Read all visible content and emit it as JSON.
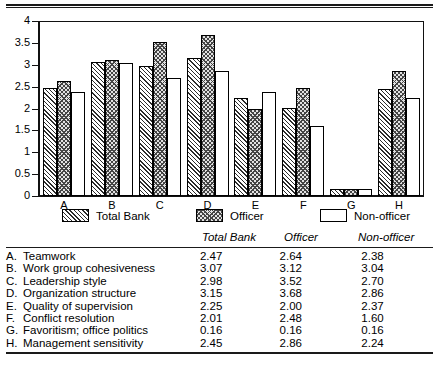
{
  "chart_data": {
    "type": "bar",
    "title": "",
    "xlabel": "",
    "ylabel": "",
    "ylim": [
      0,
      4
    ],
    "yticks": [
      "0",
      "0.5",
      "1",
      "1.5",
      "2",
      "2.5",
      "3",
      "3.5",
      "4"
    ],
    "ytick_values": [
      0,
      0.5,
      1,
      1.5,
      2,
      2.5,
      3,
      3.5,
      4
    ],
    "grid": false,
    "legend_position": "below-axis",
    "categories": [
      "A",
      "B",
      "C",
      "D",
      "E",
      "F",
      "G",
      "H"
    ],
    "series": [
      {
        "name": "Total Bank",
        "pattern": "diagonal-hatch",
        "values": [
          2.47,
          3.07,
          2.98,
          3.15,
          2.25,
          2.01,
          0.16,
          2.45
        ]
      },
      {
        "name": "Officer",
        "pattern": "crosshatch-gray",
        "values": [
          2.64,
          3.12,
          3.52,
          3.68,
          2.0,
          2.48,
          0.16,
          2.86
        ]
      },
      {
        "name": "Non-officer",
        "pattern": "open-white",
        "values": [
          2.38,
          3.04,
          2.7,
          2.86,
          2.37,
          1.6,
          0.16,
          2.24
        ]
      }
    ]
  },
  "legend": {
    "items": [
      {
        "label": "Total Bank",
        "swatch": "diagonal-hatch"
      },
      {
        "label": "Officer",
        "swatch": "crosshatch-gray"
      },
      {
        "label": "Non-officer",
        "swatch": "open-white"
      }
    ]
  },
  "table": {
    "headers": [
      "",
      "Total Bank",
      "Officer",
      "Non-officer"
    ],
    "rows": [
      {
        "letter": "A.",
        "name": "Teamwork",
        "total_bank": "2.47",
        "officer": "2.64",
        "non_officer": "2.38"
      },
      {
        "letter": "B.",
        "name": "Work group cohesiveness",
        "total_bank": "3.07",
        "officer": "3.12",
        "non_officer": "3.04"
      },
      {
        "letter": "C.",
        "name": "Leadership style",
        "total_bank": "2.98",
        "officer": "3.52",
        "non_officer": "2.70"
      },
      {
        "letter": "D.",
        "name": "Organization structure",
        "total_bank": "3.15",
        "officer": "3.68",
        "non_officer": "2.86"
      },
      {
        "letter": "E.",
        "name": "Quality of supervision",
        "total_bank": "2.25",
        "officer": "2.00",
        "non_officer": "2.37"
      },
      {
        "letter": "F.",
        "name": "Conflict resolution",
        "total_bank": "2.01",
        "officer": "2.48",
        "non_officer": "1.60"
      },
      {
        "letter": "G.",
        "name": "Favoritism; office politics",
        "total_bank": "0.16",
        "officer": "0.16",
        "non_officer": "0.16"
      },
      {
        "letter": "H.",
        "name": "Management sensitivity",
        "total_bank": "2.45",
        "officer": "2.86",
        "non_officer": "2.24"
      }
    ]
  },
  "colors": {
    "ink": "#1a1a1a",
    "hatch": "#2b2b2b",
    "officer_fill": "#e2e2e2",
    "paper": "#ffffff"
  }
}
